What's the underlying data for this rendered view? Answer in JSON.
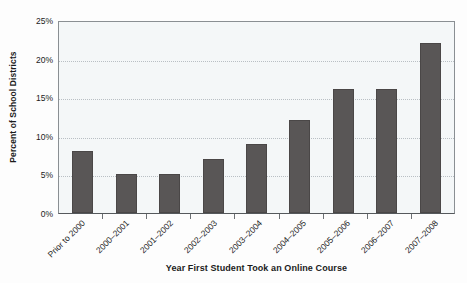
{
  "chart_data": {
    "type": "bar",
    "title": "",
    "xlabel": "Year First Student Took an Online Course",
    "ylabel": "Percent of School Districts",
    "categories": [
      "Prior to 2000",
      "2000–2001",
      "2001–2002",
      "2002–2003",
      "2003–2004",
      "2004–2005",
      "2005–2006",
      "2006–2007",
      "2007–2008"
    ],
    "values": [
      8,
      5,
      5,
      7,
      9,
      12,
      16,
      16,
      22
    ],
    "ylim": [
      0,
      25
    ],
    "ytick_values": [
      0,
      5,
      10,
      15,
      20,
      25
    ],
    "ytick_labels": [
      "0%",
      "5%",
      "10%",
      "15%",
      "20%",
      "25%"
    ],
    "grid": "horizontal-dotted",
    "legend": "none",
    "bar_color": "#595656",
    "plot_background": "#f4f7f8",
    "gridline_color": "#b9bfc4",
    "axis_color": "#8a8f93"
  }
}
